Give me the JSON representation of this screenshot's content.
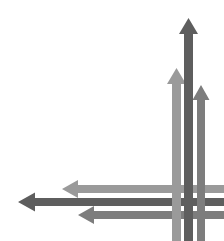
{
  "figure": {
    "background_color": "#ffffff",
    "width": 224,
    "height": 241
  },
  "palette": {
    "light_gray": "#9a9a9a",
    "medium_gray": "#7d7d7d",
    "dark_gray": "#5e5e5e"
  },
  "arrows": [
    {
      "id": "up-light",
      "label": "Upward arrow, light gray",
      "direction": "up",
      "color": "#9a9a9a",
      "shaft_x": 172,
      "shaft_width": 9,
      "tip_y": 68,
      "tail_y": 241,
      "head_width": 19,
      "head_height": 16,
      "z": 1
    },
    {
      "id": "up-dark",
      "label": "Upward arrow, dark gray",
      "direction": "up",
      "color": "#5e5e5e",
      "shaft_x": 184,
      "shaft_width": 9,
      "tip_y": 18,
      "tail_y": 241,
      "head_width": 19,
      "head_height": 16,
      "z": 3
    },
    {
      "id": "up-medium",
      "label": "Upward arrow, medium gray",
      "direction": "up",
      "color": "#7d7d7d",
      "shaft_x": 197,
      "shaft_width": 8,
      "tip_y": 85,
      "tail_y": 241,
      "head_width": 17,
      "head_height": 15,
      "z": 2
    },
    {
      "id": "left-light",
      "label": "Leftward arrow, light gray",
      "direction": "left",
      "color": "#9a9a9a",
      "shaft_y": 185,
      "shaft_height": 8,
      "tip_x": 62,
      "tail_x": 224,
      "head_width": 16,
      "head_height": 18,
      "z": 1
    },
    {
      "id": "left-dark",
      "label": "Leftward arrow, dark gray",
      "direction": "left",
      "color": "#5e5e5e",
      "shaft_y": 198,
      "shaft_height": 8,
      "tip_x": 18,
      "tail_x": 224,
      "head_width": 17,
      "head_height": 19,
      "z": 3
    },
    {
      "id": "left-medium",
      "label": "Leftward arrow, medium gray",
      "direction": "left",
      "color": "#7d7d7d",
      "shaft_y": 211,
      "shaft_height": 8,
      "tip_x": 78,
      "tail_x": 224,
      "head_width": 16,
      "head_height": 18,
      "z": 2
    }
  ],
  "weave": {
    "description": "Vertical shafts pass over horizontal shafts at alternating crossings, producing a basket-weave lattice in the lower right quadrant.",
    "over_cells": [
      {
        "vertical": "up-light",
        "horizontal": "left-light"
      },
      {
        "vertical": "up-dark",
        "horizontal": "left-dark"
      },
      {
        "vertical": "up-medium",
        "horizontal": "left-medium"
      }
    ]
  }
}
